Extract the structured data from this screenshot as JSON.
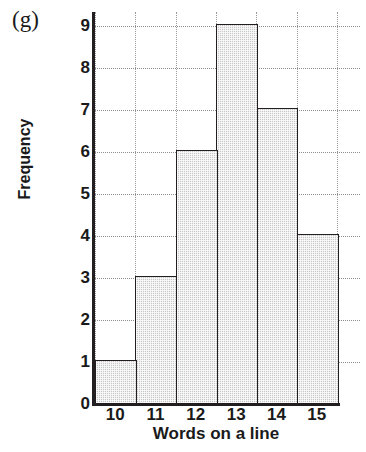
{
  "panel": {
    "label": "(g)"
  },
  "chart_data": {
    "type": "bar",
    "title": "",
    "subtitle": "",
    "xlabel": "Words on a line",
    "ylabel": "Frequency",
    "categories": [
      "10",
      "11",
      "12",
      "13",
      "14",
      "15"
    ],
    "values": [
      1,
      3,
      6,
      9,
      7,
      4
    ],
    "series": [
      {
        "name": "Frequency",
        "values": [
          1,
          3,
          6,
          9,
          7,
          4
        ]
      }
    ],
    "xlim": [
      9.5,
      15.5
    ],
    "ylim": [
      0,
      9
    ],
    "yticks": [
      0,
      1,
      2,
      3,
      4,
      5,
      6,
      7,
      8,
      9
    ],
    "ytick_labels": [
      "0",
      "1",
      "2",
      "3",
      "4",
      "5",
      "6",
      "7",
      "8",
      "9"
    ],
    "xticks": [
      10,
      11,
      12,
      13,
      14,
      15
    ],
    "xtick_labels": [
      "10",
      "11",
      "12",
      "13",
      "14",
      "15"
    ],
    "grid": true,
    "grid_style": "dotted",
    "legend": false,
    "legend_position": "none",
    "bar_fill_color": "#c9c9c9",
    "bar_edge_color": "#231f20",
    "grid_color": "#8d8d8d",
    "axis_color": "#231f20",
    "text_color": "#1a1a1a",
    "annotations": []
  }
}
